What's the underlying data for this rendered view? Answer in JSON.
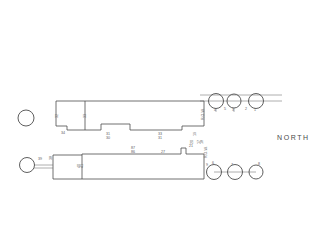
{
  "drawing": {
    "title": "Site Plan",
    "orientation_label": "NORTH",
    "background_color": "#ffffff",
    "line_color": "#4d4d4d",
    "text_color": "#5a5a5a"
  },
  "upper_building": {
    "name": "upper-building-outline",
    "dimensions": [
      {
        "id": "u1",
        "text": "32",
        "x": 58,
        "y": 118,
        "vertical": true
      },
      {
        "id": "u2",
        "text": "34",
        "x": 61,
        "y": 130,
        "vertical": false
      },
      {
        "id": "u3",
        "text": "33",
        "x": 86,
        "y": 117,
        "vertical": true
      },
      {
        "id": "u4",
        "text": "31",
        "x": 108,
        "y": 128,
        "vertical": false
      },
      {
        "id": "u5",
        "text": "30",
        "x": 108,
        "y": 131,
        "vertical": false
      },
      {
        "id": "u6",
        "text": "33",
        "x": 160,
        "y": 128,
        "vertical": false
      },
      {
        "id": "u7",
        "text": "31",
        "x": 160,
        "y": 131,
        "vertical": false
      },
      {
        "id": "u8",
        "text": "19",
        "x": 196,
        "y": 128,
        "vertical": true
      },
      {
        "id": "u9",
        "text": "17",
        "x": 199,
        "y": 134,
        "vertical": true
      },
      {
        "id": "u10",
        "text": "18",
        "x": 199,
        "y": 137,
        "vertical": true
      },
      {
        "id": "u11",
        "text": "20",
        "x": 196,
        "y": 141,
        "vertical": true
      },
      {
        "id": "u12",
        "text": "R.O.W.",
        "x": 204,
        "y": 118,
        "vertical": false
      }
    ]
  },
  "lower_building": {
    "name": "lower-building-outline",
    "dimensions": [
      {
        "id": "l1",
        "text": "39",
        "x": 39,
        "y": 158,
        "vertical": false
      },
      {
        "id": "l2",
        "text": "38",
        "x": 52,
        "y": 157,
        "vertical": true
      },
      {
        "id": "l3",
        "text": "40",
        "x": 82,
        "y": 163,
        "vertical": true
      },
      {
        "id": "l4",
        "text": "41",
        "x": 82,
        "y": 166,
        "vertical": true
      },
      {
        "id": "l5",
        "text": "87",
        "x": 133,
        "y": 148,
        "vertical": false
      },
      {
        "id": "l6",
        "text": "86",
        "x": 133,
        "y": 152,
        "vertical": false
      },
      {
        "id": "l7",
        "text": "27",
        "x": 163,
        "y": 153,
        "vertical": false
      },
      {
        "id": "l8",
        "text": "21",
        "x": 190,
        "y": 145,
        "vertical": false
      },
      {
        "id": "l9",
        "text": "R.O.W.",
        "x": 207,
        "y": 156,
        "vertical": false
      }
    ]
  },
  "trees": {
    "upper_row": [
      {
        "id": "t4",
        "label": "4",
        "cx": 216,
        "cy": 101,
        "r": 7.5
      },
      {
        "id": "t3",
        "label": "3",
        "cx": 234,
        "cy": 101,
        "r": 7.0
      },
      {
        "id": "t1",
        "label": "1",
        "cx": 256,
        "cy": 101,
        "r": 7.5
      }
    ],
    "lower_row": [
      {
        "id": "t6",
        "label": "6",
        "cx": 214,
        "cy": 172,
        "r": 7.5
      },
      {
        "id": "t7",
        "label": "7",
        "cx": 235,
        "cy": 172,
        "r": 7.5
      },
      {
        "id": "t8",
        "label": "8",
        "cx": 256,
        "cy": 172,
        "r": 7.0
      }
    ],
    "standalone": [
      {
        "id": "t-left-upper",
        "label": "",
        "cx": 26,
        "cy": 118,
        "r": 8.0
      },
      {
        "id": "t-left-lower",
        "label": "",
        "cx": 27,
        "cy": 165,
        "r": 7.5
      }
    ]
  },
  "labels_extra": [
    {
      "id": "tick5",
      "text": "5",
      "x": 225,
      "y": 110
    },
    {
      "id": "tick2",
      "text": "2",
      "x": 246,
      "y": 110
    },
    {
      "id": "tick9",
      "text": "9",
      "x": 207,
      "y": 164
    }
  ]
}
